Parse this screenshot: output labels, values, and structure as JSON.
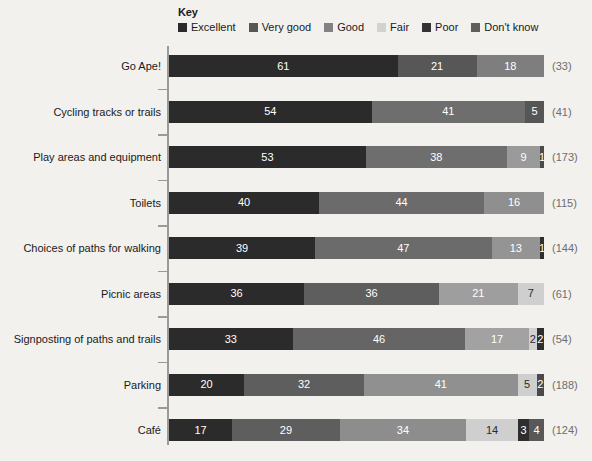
{
  "legend": {
    "title": "Key",
    "items": [
      {
        "label": "Excellent",
        "color": "#2b2b2b",
        "key": "excellent"
      },
      {
        "label": "Very good",
        "color": "#575757",
        "key": "very_good"
      },
      {
        "label": "Good",
        "color": "#828282",
        "key": "good"
      },
      {
        "label": "Fair",
        "color": "#d2d2d2",
        "key": "fair"
      },
      {
        "label": "Poor",
        "color": "#333333",
        "key": "poor"
      },
      {
        "label": "Don't know",
        "color": "#5e5e5e",
        "key": "dont_know"
      }
    ]
  },
  "chart_data": {
    "type": "bar",
    "title": "",
    "subtitle": "",
    "xlabel": "",
    "ylabel": "",
    "orientation": "horizontal",
    "stacked": true,
    "stack_total": 100,
    "grid": false,
    "legend_position": "top",
    "series": [
      {
        "name": "Excellent",
        "color": "#2b2b2b",
        "values": [
          61,
          54,
          53,
          40,
          39,
          36,
          33,
          20,
          17
        ]
      },
      {
        "name": "Very good",
        "color": "#575757",
        "values": [
          21,
          41,
          38,
          44,
          47,
          36,
          46,
          32,
          29
        ]
      },
      {
        "name": "Good",
        "color": "#828282",
        "values": [
          18,
          5,
          9,
          16,
          13,
          21,
          17,
          41,
          34
        ]
      },
      {
        "name": "Fair",
        "color": "#d2d2d2",
        "values": [
          0,
          0,
          1,
          0,
          1,
          7,
          2,
          5,
          14
        ]
      },
      {
        "name": "Poor",
        "color": "#333333",
        "values": [
          0,
          0,
          0,
          0,
          0,
          0,
          2,
          0,
          3
        ]
      },
      {
        "name": "Don't know",
        "color": "#5e5e5e",
        "values": [
          0,
          0,
          0,
          0,
          0,
          0,
          0,
          2,
          4
        ]
      }
    ],
    "categories": [
      "Go Ape!",
      "Cycling tracks or trails",
      "Play areas and equipment",
      "Toilets",
      "Choices of paths for walking",
      "Picnic areas",
      "Signposting of paths and trails",
      "Parking",
      "Café"
    ],
    "base_label_format": "(n)",
    "bases": [
      33,
      41,
      173,
      115,
      144,
      61,
      54,
      188,
      124
    ]
  },
  "rows": [
    {
      "label": "Go Ape!",
      "base": "(33)",
      "segments": [
        {
          "series": "Excellent",
          "value": 61,
          "display": "61",
          "color": "#2b2b2b",
          "light": false
        },
        {
          "series": "Very good",
          "value": 21,
          "display": "21",
          "color": "#575757",
          "light": false
        },
        {
          "series": "Good",
          "value": 18,
          "display": "18",
          "color": "#7e7e7e",
          "light": false
        }
      ]
    },
    {
      "label": "Cycling tracks or trails",
      "base": "(41)",
      "segments": [
        {
          "series": "Excellent",
          "value": 54,
          "display": "54",
          "color": "#2b2b2b",
          "light": false
        },
        {
          "series": "Very good",
          "value": 41,
          "display": "41",
          "color": "#6e6e6e",
          "light": false
        },
        {
          "series": "Good",
          "value": 5,
          "display": "5",
          "color": "#565656",
          "light": false
        }
      ]
    },
    {
      "label": "Play areas and equipment",
      "base": "(173)",
      "segments": [
        {
          "series": "Excellent",
          "value": 53,
          "display": "53",
          "color": "#2b2b2b",
          "light": false
        },
        {
          "series": "Very good",
          "value": 38,
          "display": "38",
          "color": "#6e6e6e",
          "light": false
        },
        {
          "series": "Good",
          "value": 9,
          "display": "9",
          "color": "#9a9a9a",
          "light": false
        },
        {
          "series": "Fair",
          "value": 1,
          "display": "1",
          "color": "#4a4a4a",
          "light": false
        }
      ]
    },
    {
      "label": "Toilets",
      "base": "(115)",
      "segments": [
        {
          "series": "Excellent",
          "value": 40,
          "display": "40",
          "color": "#2b2b2b",
          "light": false
        },
        {
          "series": "Very good",
          "value": 44,
          "display": "44",
          "color": "#6b6b6b",
          "light": false
        },
        {
          "series": "Good",
          "value": 16,
          "display": "16",
          "color": "#8f8f8f",
          "light": false
        }
      ]
    },
    {
      "label": "Choices of paths for walking",
      "base": "(144)",
      "segments": [
        {
          "series": "Excellent",
          "value": 39,
          "display": "39",
          "color": "#2b2b2b",
          "light": false
        },
        {
          "series": "Very good",
          "value": 47,
          "display": "47",
          "color": "#6b6b6b",
          "light": false
        },
        {
          "series": "Good",
          "value": 13,
          "display": "13",
          "color": "#949494",
          "light": false
        },
        {
          "series": "Fair",
          "value": 1,
          "display": "1",
          "color": "#2e2e2e",
          "light": false
        }
      ]
    },
    {
      "label": "Picnic areas",
      "base": "(61)",
      "segments": [
        {
          "series": "Excellent",
          "value": 36,
          "display": "36",
          "color": "#2b2b2b",
          "light": false
        },
        {
          "series": "Very good",
          "value": 36,
          "display": "36",
          "color": "#5e5e5e",
          "light": false
        },
        {
          "series": "Good",
          "value": 21,
          "display": "21",
          "color": "#9e9e9e",
          "light": false
        },
        {
          "series": "Fair",
          "value": 7,
          "display": "7",
          "color": "#cfcfcf",
          "light": true
        }
      ]
    },
    {
      "label": "Signposting of paths and trails",
      "base": "(54)",
      "segments": [
        {
          "series": "Excellent",
          "value": 33,
          "display": "33",
          "color": "#2b2b2b",
          "light": false
        },
        {
          "series": "Very good",
          "value": 46,
          "display": "46",
          "color": "#656565",
          "light": false
        },
        {
          "series": "Good",
          "value": 17,
          "display": "17",
          "color": "#a2a2a2",
          "light": false
        },
        {
          "series": "Poor",
          "value": 2,
          "display": "2",
          "color": "#d2d2d2",
          "light": true
        },
        {
          "series": "Don't know",
          "value": 2,
          "display": "2",
          "color": "#2e2e2e",
          "light": false
        }
      ]
    },
    {
      "label": "Parking",
      "base": "(188)",
      "segments": [
        {
          "series": "Excellent",
          "value": 20,
          "display": "20",
          "color": "#2b2b2b",
          "light": false
        },
        {
          "series": "Very good",
          "value": 32,
          "display": "32",
          "color": "#5e5e5e",
          "light": false
        },
        {
          "series": "Good",
          "value": 41,
          "display": "41",
          "color": "#909090",
          "light": false
        },
        {
          "series": "Fair",
          "value": 5,
          "display": "5",
          "color": "#cfcfcf",
          "light": true
        },
        {
          "series": "Don't know",
          "value": 2,
          "display": "2",
          "color": "#4a4a4a",
          "light": false
        }
      ]
    },
    {
      "label": "Café",
      "base": "(124)",
      "segments": [
        {
          "series": "Excellent",
          "value": 17,
          "display": "17",
          "color": "#2b2b2b",
          "light": false
        },
        {
          "series": "Very good",
          "value": 29,
          "display": "29",
          "color": "#5e5e5e",
          "light": false
        },
        {
          "series": "Good",
          "value": 34,
          "display": "34",
          "color": "#8d8d8d",
          "light": false
        },
        {
          "series": "Fair",
          "value": 14,
          "display": "14",
          "color": "#cfcfcf",
          "light": true
        },
        {
          "series": "Poor",
          "value": 3,
          "display": "3",
          "color": "#2e2e2e",
          "light": false
        },
        {
          "series": "Don't know",
          "value": 4,
          "display": "4",
          "color": "#585858",
          "light": false
        }
      ]
    }
  ],
  "axis": {
    "tick_count": 8
  }
}
